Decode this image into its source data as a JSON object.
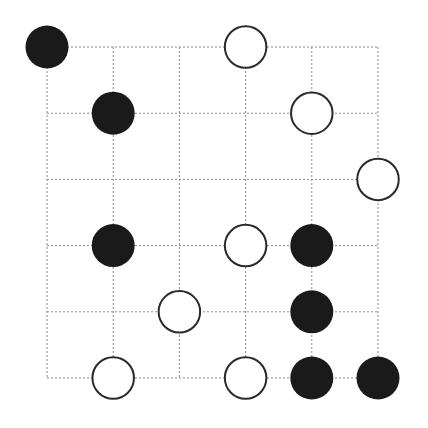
{
  "board": {
    "grid_size": 6,
    "origin_x": 47,
    "origin_y": 47,
    "spacing": 66.2,
    "stone_radius": 21.5,
    "line_color": "#8a8a8a",
    "black_color": "#1a1a1a",
    "white_fill": "#ffffff",
    "white_stroke": "#2a2a2a"
  },
  "stones": [
    {
      "color": "black",
      "col": 0,
      "row": 0
    },
    {
      "color": "white",
      "col": 3,
      "row": 0
    },
    {
      "color": "black",
      "col": 1,
      "row": 1
    },
    {
      "color": "white",
      "col": 4,
      "row": 1
    },
    {
      "color": "white",
      "col": 5,
      "row": 2
    },
    {
      "color": "black",
      "col": 1,
      "row": 3
    },
    {
      "color": "white",
      "col": 3,
      "row": 3
    },
    {
      "color": "black",
      "col": 4,
      "row": 3
    },
    {
      "color": "white",
      "col": 2,
      "row": 4
    },
    {
      "color": "black",
      "col": 4,
      "row": 4
    },
    {
      "color": "white",
      "col": 1,
      "row": 5
    },
    {
      "color": "white",
      "col": 3,
      "row": 5
    },
    {
      "color": "black",
      "col": 4,
      "row": 5
    },
    {
      "color": "black",
      "col": 5,
      "row": 5
    }
  ]
}
